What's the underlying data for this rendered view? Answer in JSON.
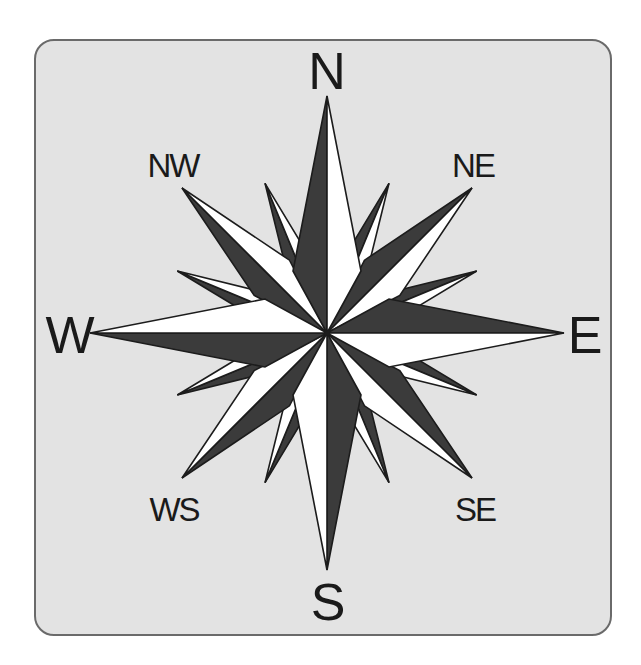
{
  "diagram": {
    "type": "compass-rose",
    "colors": {
      "page_background": "#ffffff",
      "panel_background": "#e3e3e3",
      "panel_border": "#6a6a6a",
      "dark_fill": "#3b3b3b",
      "light_fill": "#ffffff",
      "outline": "#1c1c1c",
      "label_text": "#1a1a1a"
    },
    "center": {
      "x": 327,
      "y": 333
    },
    "labels": {
      "north": {
        "text": "N",
        "x": 327,
        "y": 71
      },
      "south": {
        "text": "S",
        "x": 328,
        "y": 602
      },
      "west": {
        "text": "W",
        "x": 70,
        "y": 335
      },
      "east": {
        "text": "E",
        "x": 585,
        "y": 335
      },
      "northwest": {
        "text": "NW",
        "x": 173,
        "y": 165
      },
      "northeast": {
        "text": "NE",
        "x": 473,
        "y": 165
      },
      "southwest": {
        "text": "WS",
        "x": 174,
        "y": 509
      },
      "southeast": {
        "text": "SE",
        "x": 475,
        "y": 509
      }
    },
    "points": {
      "cardinal": {
        "directions": [
          "N",
          "E",
          "S",
          "W"
        ],
        "angles_deg": [
          0,
          90,
          180,
          270
        ],
        "length": 237,
        "shoulder_along": 62,
        "shoulder_perp": 34
      },
      "intercardinal": {
        "directions": [
          "NE",
          "SE",
          "SW",
          "NW"
        ],
        "angles_deg": [
          45,
          135,
          225,
          315
        ],
        "length": 205,
        "shoulder_along": 78,
        "shoulder_perp": 25
      },
      "minor": {
        "directions": [
          "NNE",
          "ENE",
          "ESE",
          "SSE",
          "SSW",
          "WSW",
          "WNW",
          "NNW"
        ],
        "angles_deg": [
          22.5,
          67.5,
          112.5,
          157.5,
          202.5,
          247.5,
          292.5,
          337.5
        ],
        "length": 162,
        "shoulder_along": 70,
        "shoulder_perp": 14
      }
    }
  }
}
